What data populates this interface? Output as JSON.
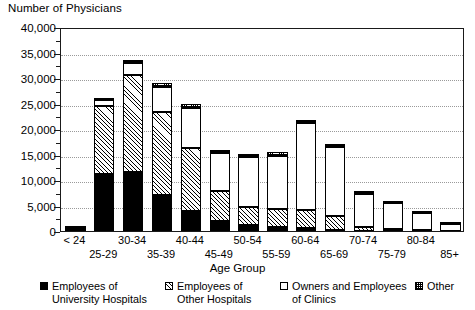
{
  "chart_data": {
    "type": "bar",
    "subtype": "stacked",
    "title": "",
    "ylabel": "Number of Physicians",
    "xlabel": "Age Group",
    "ylim": [
      0,
      40000
    ],
    "ytick_values": [
      0,
      5000,
      10000,
      15000,
      20000,
      25000,
      30000,
      35000,
      40000
    ],
    "ytick_labels": [
      "0",
      "5,000",
      "10,000",
      "15,000",
      "20,000",
      "25,000",
      "30,000",
      "35,000",
      "40,000"
    ],
    "grid": true,
    "grid_axis": "y",
    "legend_position": "bottom",
    "categories": [
      "< 24",
      "25-29",
      "30-34",
      "35-39",
      "40-44",
      "45-49",
      "50-54",
      "55-59",
      "60-64",
      "65-69",
      "70-74",
      "75-79",
      "80-84",
      "85+"
    ],
    "series": [
      {
        "name": "Employees of University Hospitals",
        "pattern": "solid-black",
        "values": [
          400,
          11200,
          11600,
          7000,
          4000,
          1900,
          1100,
          700,
          600,
          200,
          100,
          50,
          40,
          20
        ]
      },
      {
        "name": "Employees of Other Hospitals",
        "pattern": "diagonal-hatch",
        "values": [
          100,
          13400,
          18900,
          16400,
          12300,
          5900,
          3700,
          3700,
          3600,
          2700,
          700,
          300,
          150,
          60
        ]
      },
      {
        "name": "Owners and Employees of Clinics",
        "pattern": "white",
        "values": [
          50,
          1000,
          2400,
          4900,
          7900,
          7500,
          9800,
          10400,
          17000,
          13500,
          6500,
          5100,
          3400,
          1300
        ]
      },
      {
        "name": "Other",
        "pattern": "fine-checker",
        "values": [
          50,
          500,
          700,
          800,
          700,
          600,
          600,
          600,
          600,
          600,
          500,
          400,
          300,
          200
        ]
      }
    ],
    "totals": [
      600,
      26100,
      33600,
      29100,
      24900,
      15900,
      15200,
      15400,
      21800,
      17000,
      7800,
      5850,
      3890,
      1580
    ]
  },
  "legend": {
    "items": [
      {
        "label": "Employees of\nUniversity Hospitals",
        "pattern": "solid-black"
      },
      {
        "label": "Employees of\nOther Hospitals",
        "pattern": "diagonal-hatch"
      },
      {
        "label": "Owners and Employees\nof Clinics",
        "pattern": "white"
      },
      {
        "label": "Other",
        "pattern": "fine-checker"
      }
    ]
  },
  "colors": {
    "axis": "#1a1a1a",
    "grid": "#9a9a9a",
    "background": "#ffffff",
    "ink": "#000000"
  }
}
